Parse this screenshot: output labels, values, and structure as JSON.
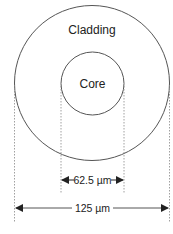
{
  "diagram": {
    "type": "optical-fiber-cross-section",
    "labels": {
      "cladding": "Cladding",
      "core": "Core"
    },
    "dimensions": {
      "core_diameter": "62.5 µm",
      "cladding_diameter": "125 µm"
    },
    "colors": {
      "stroke": "#555555",
      "dashed": "#888888",
      "text": "#222222",
      "background": "#ffffff"
    }
  }
}
